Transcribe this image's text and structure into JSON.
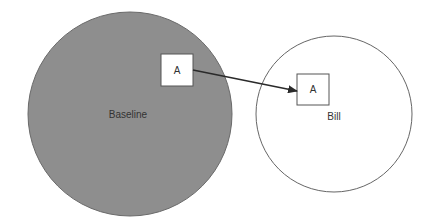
{
  "diagram": {
    "colors": {
      "baseline_fill": "#8e8e8e",
      "stroke": "#555555",
      "box_fill": "#ffffff",
      "arrow": "#2a2a2a"
    },
    "nodes": {
      "baseline_circle": {
        "label": "Baseline",
        "cx": 130,
        "cy": 114,
        "r": 102
      },
      "bill_circle": {
        "label": "Bill",
        "cx": 334,
        "cy": 114,
        "r": 78
      },
      "box_a_baseline": {
        "label": "A",
        "x": 161,
        "y": 54,
        "w": 32,
        "h": 32
      },
      "box_a_bill": {
        "label": "A",
        "x": 297,
        "y": 74,
        "w": 32,
        "h": 31
      }
    },
    "edges": [
      {
        "from": "box_a_baseline",
        "to": "box_a_bill",
        "type": "arrow"
      }
    ]
  }
}
